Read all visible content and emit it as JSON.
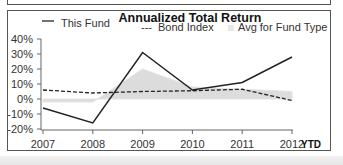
{
  "chart_data": {
    "type": "line",
    "title": "Annualized Total Return",
    "xlabel": "",
    "ylabel": "",
    "categories": [
      "2007",
      "2008",
      "2009",
      "2010",
      "2011",
      "2012"
    ],
    "x_suffix_label": "YTD",
    "ylim": [
      -20,
      40
    ],
    "yticks": [
      "40%",
      "30%",
      "20%",
      "10%",
      "0%",
      "-10%",
      "-20%"
    ],
    "grid": false,
    "legend_position": "top",
    "series": [
      {
        "name": "This Fund",
        "style": "solid-line",
        "color": "#222222",
        "values": [
          -6,
          -16,
          31,
          6,
          11,
          28
        ]
      },
      {
        "name": "Bond Index",
        "style": "dashed-line",
        "color": "#222222",
        "values": [
          6,
          4,
          5,
          5.5,
          6.5,
          -1
        ]
      },
      {
        "name": "Avg for Fund Type",
        "style": "area",
        "color": "#dcdcdc",
        "values": [
          -2,
          -2,
          20,
          8,
          6.5,
          5
        ]
      }
    ]
  },
  "legend": {
    "this_fund": "This Fund",
    "bond_index": "Bond Index",
    "avg_fund_type": "Avg for Fund Type",
    "bond_marker": "---"
  },
  "axis": {
    "y": [
      "40%",
      "30%",
      "20%",
      "10%",
      "0%",
      "-10%",
      "-20%"
    ],
    "x": [
      "2007",
      "2008",
      "2009",
      "2010",
      "2011",
      "2012"
    ],
    "ytd": "YTD"
  }
}
